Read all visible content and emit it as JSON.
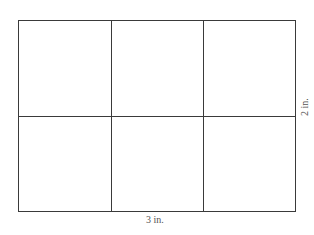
{
  "diagram": {
    "type": "rectangle grid",
    "columns": 3,
    "rows": 2,
    "line_color": "#3a3a3a",
    "width_label": "3 in.",
    "height_label": "2 in."
  }
}
